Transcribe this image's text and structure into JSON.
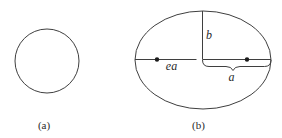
{
  "diagram": {
    "panels": [
      {
        "id": "a",
        "shape": "circle",
        "caption": "(a)"
      },
      {
        "id": "b",
        "shape": "ellipse",
        "caption": "(b)",
        "foci_count": 2,
        "annotations": {
          "semi_minor_axis": "b",
          "focus_distance": "ea",
          "semi_major_axis": "a"
        }
      }
    ],
    "colors": {
      "line": "#3f3f3f",
      "text": "#2a2a2a",
      "dot": "#1c1c1c",
      "background": "#ffffff"
    }
  }
}
